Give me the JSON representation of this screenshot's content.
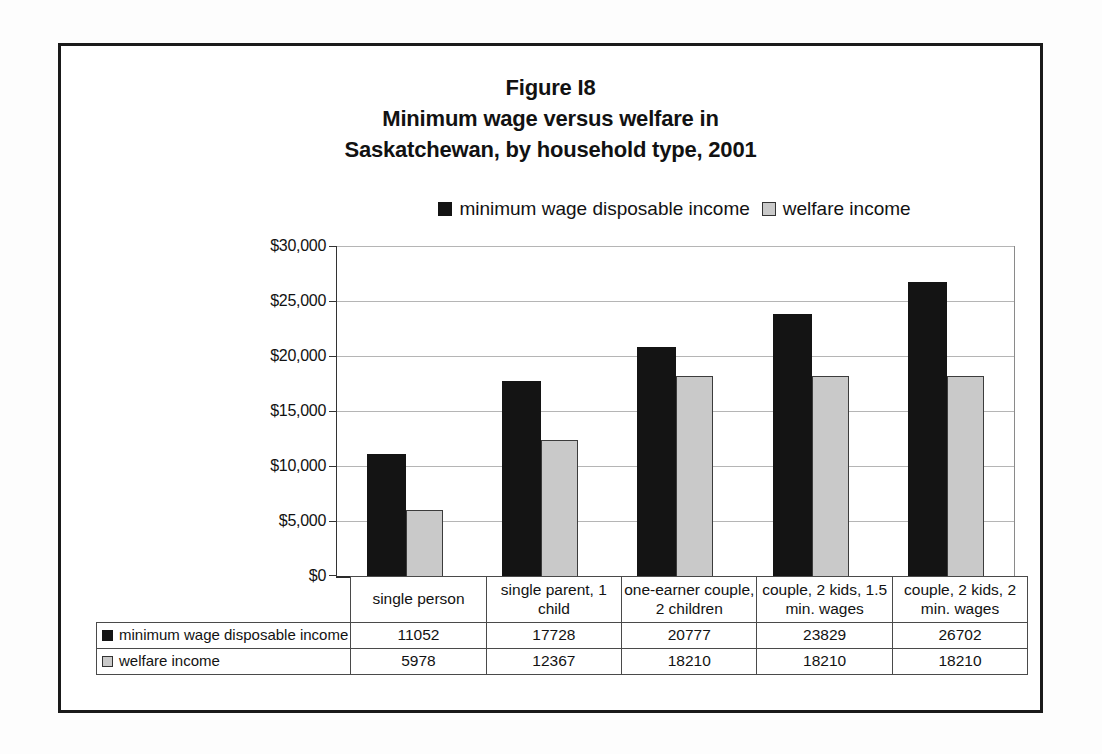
{
  "figure": {
    "title_line1": "Figure I8",
    "title_line2": "Minimum wage versus welfare in",
    "title_line3": "Saskatchewan, by household type, 2001"
  },
  "chart_data": {
    "type": "bar",
    "categories": [
      "single person",
      "single parent, 1 child",
      "one-earner couple, 2 children",
      "couple, 2 kids, 1.5 min. wages",
      "couple, 2 kids, 2 min. wages"
    ],
    "series": [
      {
        "name": "minimum wage disposable income",
        "color": "#141414",
        "values": [
          11052,
          17728,
          20777,
          23829,
          26702
        ]
      },
      {
        "name": "welfare income",
        "color": "#c9c9c9",
        "values": [
          5978,
          12367,
          18210,
          18210,
          18210
        ]
      }
    ],
    "xlabel": "",
    "ylabel": "",
    "ylim": [
      0,
      30000
    ],
    "ytick_interval": 5000,
    "ytick_labels": [
      "$0",
      "$5,000",
      "$10,000",
      "$15,000",
      "$20,000",
      "$25,000",
      "$30,000"
    ],
    "grid": true,
    "legend_position": "top",
    "data_table_shown": true
  }
}
